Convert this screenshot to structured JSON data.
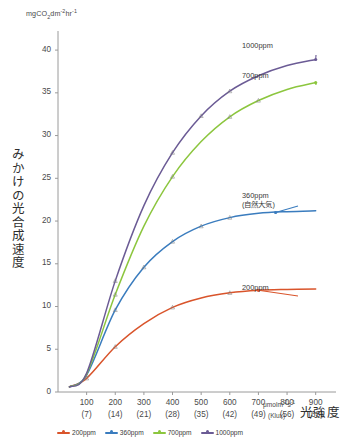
{
  "chart_data": {
    "type": "line",
    "title": "",
    "subtitle": "",
    "ylabel": "みかけの光合成速度",
    "yunit": "mgCO2dm-2hr-1",
    "yunit_parts": {
      "pre": "mgCO",
      "sub": "2",
      "mid": "dm",
      "sup1": "-2",
      "mid2": "hr",
      "sup2": "-1"
    },
    "xlabel": "光強度",
    "xunit_primary": "μmolm-2s-1",
    "xunit_primary_parts": {
      "pre": "μmolm",
      "sup1": "-2",
      "mid": "s",
      "sup2": "-1"
    },
    "xunit_secondary": "(Klux)",
    "ylim": [
      0,
      42
    ],
    "yticks": [
      0,
      5,
      10,
      15,
      20,
      25,
      30,
      35,
      40
    ],
    "ytick_labels": [
      "0",
      "5",
      "10",
      "15",
      "20",
      "25",
      "30",
      "35",
      "40"
    ],
    "xlim": [
      0,
      950
    ],
    "xticks": [
      100,
      200,
      300,
      400,
      500,
      600,
      700,
      800,
      900
    ],
    "xtick_labels": [
      "100",
      "200",
      "300",
      "400",
      "500",
      "600",
      "700",
      "800",
      "900"
    ],
    "xtick_labels_secondary": [
      "(7)",
      "(14)",
      "(21)",
      "(28)",
      "(35)",
      "(42)",
      "(49)",
      "(56)",
      "(63)"
    ],
    "grid": false,
    "legend_position": "below-axis",
    "series": [
      {
        "name": "200ppm",
        "color": "#D9542B",
        "inline_label": "200ppm",
        "inline_sublabel": "",
        "x": [
          100,
          200,
          300,
          400,
          500,
          600,
          700,
          800,
          900
        ],
        "values": [
          1.6,
          5.3,
          8.0,
          9.9,
          11.0,
          11.6,
          11.9,
          12.0,
          12.05
        ],
        "markers_x": [
          100,
          200,
          400,
          600
        ],
        "markers_y": [
          1.6,
          5.3,
          9.9,
          11.6
        ]
      },
      {
        "name": "360ppm",
        "color": "#3A7CBE",
        "inline_label": "360ppm",
        "inline_sublabel": "(自然大気)",
        "x": [
          100,
          200,
          300,
          400,
          500,
          600,
          700,
          800,
          900
        ],
        "values": [
          2.0,
          9.6,
          14.6,
          17.6,
          19.4,
          20.4,
          20.9,
          21.1,
          21.2
        ],
        "markers_x": [
          100,
          200,
          300,
          400,
          500,
          600
        ],
        "markers_y": [
          2.0,
          9.6,
          14.6,
          17.6,
          19.4,
          20.4
        ]
      },
      {
        "name": "700ppm",
        "color": "#8CC63E",
        "inline_label": "700ppm",
        "inline_sublabel": "",
        "x": [
          100,
          200,
          300,
          400,
          500,
          600,
          700,
          800,
          900
        ],
        "values": [
          2.1,
          11.4,
          19.4,
          25.2,
          29.3,
          32.2,
          34.1,
          35.4,
          36.2
        ],
        "markers_x": [
          200,
          400,
          600,
          700
        ],
        "markers_y": [
          11.4,
          25.2,
          32.2,
          34.1
        ]
      },
      {
        "name": "1000ppm",
        "color": "#6B5B95",
        "inline_label": "1000ppm",
        "inline_sublabel": "",
        "x": [
          100,
          200,
          300,
          400,
          500,
          600,
          700,
          800,
          900
        ],
        "values": [
          2.2,
          13.0,
          21.8,
          28.0,
          32.3,
          35.2,
          37.0,
          38.2,
          38.9
        ],
        "markers_x": [
          200,
          400,
          500,
          600
        ],
        "markers_y": [
          13.0,
          28.0,
          32.3,
          35.2
        ]
      }
    ]
  },
  "legend": {
    "items": [
      {
        "label": "200ppm",
        "color": "#D9542B"
      },
      {
        "label": "360ppm",
        "color": "#3A7CBE"
      },
      {
        "label": "700ppm",
        "color": "#8CC63E"
      },
      {
        "label": "1000ppm",
        "color": "#6B5B95"
      }
    ]
  }
}
